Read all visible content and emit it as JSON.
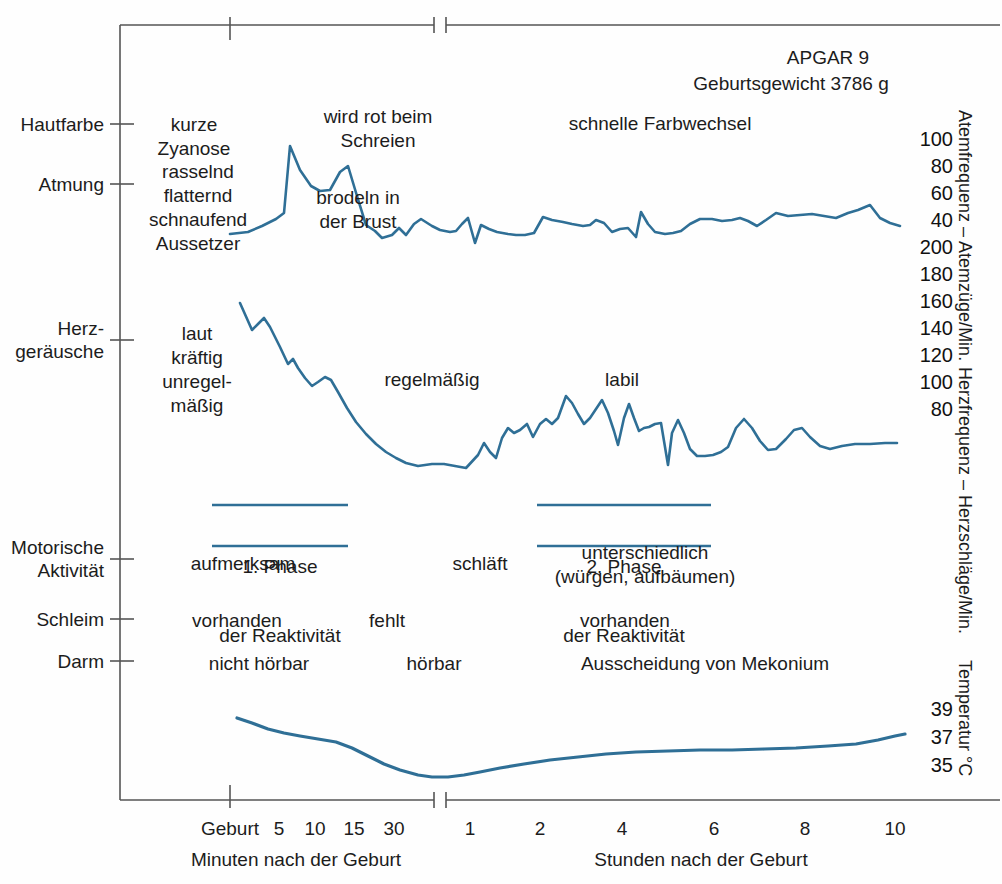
{
  "header": {
    "apgar": "APGAR 9",
    "birth_weight": "Geburtsgewicht 3786 g"
  },
  "left_categories": [
    {
      "label": "Hautfarbe",
      "y": 124
    },
    {
      "label": "Atmung",
      "y": 184
    },
    {
      "label": "Herz-\ngeräusche",
      "y": 340
    },
    {
      "label": "Motorische\nAktivität",
      "y": 559
    },
    {
      "label": "Schleim",
      "y": 619
    },
    {
      "label": "Darm",
      "y": 661
    }
  ],
  "annotations": {
    "skin_color_early": "kurze\nZyanose",
    "skin_color_crying": "wird rot beim\nSchreien",
    "skin_color_fast": "schnelle Farbwechsel",
    "breathing_early": "rasselnd\nflatternd\nschnaufend\nAussetzer",
    "breathing_rattle": "brodeln in\nder Brust",
    "heart_sounds_early": "laut\nkräftig\nunregel-\nmäßig",
    "heart_regular": "regelmäßig",
    "heart_labile": "labil",
    "motor_alert": "aufmerksam",
    "motor_sleeps": "schläft",
    "motor_varied": "unterschiedlich\n(würgen, aufbäumen)",
    "mucus_present_1": "vorhanden",
    "mucus_absent": "fehlt",
    "mucus_present_2": "vorhanden",
    "bowel_not_audible": "nicht hörbar",
    "bowel_audible": "hörbar",
    "bowel_meconium": "Ausscheidung von Mekonium"
  },
  "phases": [
    {
      "line1": "1. Phase",
      "line2": "der Reaktivität",
      "x": 280,
      "y": 505,
      "width": 136
    },
    {
      "line1": "2. Phase",
      "line2": "der Reaktivität",
      "x": 624,
      "y": 505,
      "width": 174
    }
  ],
  "right_axes": {
    "respiration": {
      "title": "Atemfrequenz – Atemzüge/Min.",
      "ticks": [
        "100",
        "80",
        "60",
        "40"
      ]
    },
    "heart_rate": {
      "title": "Herzfrequenz – Herzschläge/Min.",
      "ticks": [
        "200",
        "180",
        "160",
        "140",
        "120",
        "100",
        "80"
      ]
    },
    "temperature": {
      "title": "Temperatur °C",
      "ticks": [
        "39",
        "37",
        "35"
      ]
    }
  },
  "x_axis": {
    "left_caption": "Minuten nach der Geburt",
    "right_caption": "Stunden nach der Geburt",
    "minute_ticks": [
      "Geburt",
      "5",
      "10",
      "15",
      "30"
    ],
    "hour_ticks": [
      "1",
      "2",
      "4",
      "6",
      "8",
      "10"
    ]
  },
  "colors": {
    "curve": "#2f6f96",
    "phase_bar": "#2f6f96",
    "axis": "#555555",
    "text": "#1c1c1c"
  },
  "chart_data": {
    "type": "line",
    "xlabel": "Minuten nach der Geburt / Stunden nach der Geburt",
    "ylabel": "Atemfrequenz – Atemzüge/Min.; Herzfrequenz – Herzschläge/Min.; Temperatur °C",
    "grid": false,
    "legend": "none",
    "axis_break_at_x_px": 440,
    "x_ticks_minutes": [
      {
        "label": "Geburt",
        "px": 230
      },
      {
        "label": "5",
        "px": 277
      },
      {
        "label": "10",
        "px": 313
      },
      {
        "label": "15",
        "px": 352
      },
      {
        "label": "30",
        "px": 394
      }
    ],
    "x_ticks_hours": [
      {
        "label": "1",
        "px": 470
      },
      {
        "label": "2",
        "px": 540
      },
      {
        "label": "4",
        "px": 622
      },
      {
        "label": "6",
        "px": 714
      },
      {
        "label": "8",
        "px": 805
      },
      {
        "label": "10",
        "px": 895
      }
    ],
    "series": [
      {
        "name": "Atemfrequenz (Atemzüge/Min.)",
        "ylim": [
          40,
          100
        ],
        "y_ticks": [
          100,
          80,
          60,
          40
        ],
        "points_px": [
          [
            230,
            234
          ],
          [
            248,
            232
          ],
          [
            262,
            226
          ],
          [
            276,
            219
          ],
          [
            284,
            213
          ],
          [
            290,
            146
          ],
          [
            300,
            170
          ],
          [
            311,
            186
          ],
          [
            320,
            191
          ],
          [
            330,
            190
          ],
          [
            340,
            172
          ],
          [
            348,
            166
          ],
          [
            357,
            196
          ],
          [
            366,
            225
          ],
          [
            375,
            231
          ],
          [
            382,
            238
          ],
          [
            392,
            235
          ],
          [
            399,
            228
          ],
          [
            406,
            235
          ],
          [
            414,
            224
          ],
          [
            421,
            219
          ],
          [
            432,
            226
          ],
          [
            440,
            230
          ],
          [
            450,
            232
          ],
          [
            456,
            231
          ],
          [
            462,
            224
          ],
          [
            468,
            218
          ],
          [
            475,
            243
          ],
          [
            481,
            225
          ],
          [
            489,
            229
          ],
          [
            497,
            232
          ],
          [
            508,
            234
          ],
          [
            516,
            235
          ],
          [
            525,
            235
          ],
          [
            534,
            233
          ],
          [
            543,
            217
          ],
          [
            552,
            220
          ],
          [
            563,
            222
          ],
          [
            572,
            224
          ],
          [
            583,
            226
          ],
          [
            590,
            225
          ],
          [
            596,
            220
          ],
          [
            604,
            223
          ],
          [
            612,
            232
          ],
          [
            620,
            229
          ],
          [
            628,
            228
          ],
          [
            636,
            237
          ],
          [
            641,
            212
          ],
          [
            648,
            224
          ],
          [
            655,
            232
          ],
          [
            665,
            234
          ],
          [
            673,
            233
          ],
          [
            681,
            231
          ],
          [
            690,
            224
          ],
          [
            700,
            219
          ],
          [
            712,
            219
          ],
          [
            722,
            221
          ],
          [
            732,
            220
          ],
          [
            740,
            218
          ],
          [
            748,
            221
          ],
          [
            757,
            226
          ],
          [
            766,
            220
          ],
          [
            776,
            213
          ],
          [
            788,
            216
          ],
          [
            800,
            215
          ],
          [
            812,
            214
          ],
          [
            824,
            216
          ],
          [
            836,
            218
          ],
          [
            848,
            213
          ],
          [
            858,
            210
          ],
          [
            870,
            205
          ],
          [
            880,
            218
          ],
          [
            890,
            223
          ],
          [
            900,
            226
          ]
        ]
      },
      {
        "name": "Herzfrequenz (Herzschläge/Min.)",
        "ylim": [
          80,
          200
        ],
        "y_ticks": [
          200,
          180,
          160,
          140,
          120,
          100,
          80
        ],
        "points_px": [
          [
            240,
            303
          ],
          [
            252,
            330
          ],
          [
            258,
            324
          ],
          [
            264,
            318
          ],
          [
            270,
            327
          ],
          [
            280,
            347
          ],
          [
            288,
            364
          ],
          [
            293,
            359
          ],
          [
            298,
            368
          ],
          [
            305,
            378
          ],
          [
            312,
            386
          ],
          [
            318,
            382
          ],
          [
            325,
            377
          ],
          [
            331,
            380
          ],
          [
            338,
            392
          ],
          [
            347,
            408
          ],
          [
            356,
            422
          ],
          [
            366,
            434
          ],
          [
            376,
            444
          ],
          [
            386,
            452
          ],
          [
            396,
            458
          ],
          [
            406,
            463
          ],
          [
            418,
            466
          ],
          [
            432,
            464
          ],
          [
            444,
            464
          ],
          [
            455,
            466
          ],
          [
            466,
            468
          ],
          [
            478,
            455
          ],
          [
            484,
            443
          ],
          [
            490,
            452
          ],
          [
            496,
            458
          ],
          [
            502,
            438
          ],
          [
            508,
            428
          ],
          [
            514,
            433
          ],
          [
            520,
            430
          ],
          [
            527,
            424
          ],
          [
            533,
            437
          ],
          [
            540,
            424
          ],
          [
            546,
            419
          ],
          [
            552,
            424
          ],
          [
            558,
            418
          ],
          [
            566,
            396
          ],
          [
            572,
            403
          ],
          [
            578,
            414
          ],
          [
            584,
            424
          ],
          [
            590,
            418
          ],
          [
            596,
            409
          ],
          [
            602,
            400
          ],
          [
            608,
            413
          ],
          [
            614,
            431
          ],
          [
            618,
            445
          ],
          [
            624,
            418
          ],
          [
            629,
            404
          ],
          [
            634,
            418
          ],
          [
            639,
            431
          ],
          [
            644,
            428
          ],
          [
            649,
            427
          ],
          [
            655,
            424
          ],
          [
            661,
            423
          ],
          [
            668,
            465
          ],
          [
            672,
            433
          ],
          [
            678,
            420
          ],
          [
            684,
            433
          ],
          [
            690,
            449
          ],
          [
            697,
            456
          ],
          [
            705,
            456
          ],
          [
            713,
            455
          ],
          [
            721,
            452
          ],
          [
            728,
            447
          ],
          [
            736,
            428
          ],
          [
            744,
            419
          ],
          [
            752,
            428
          ],
          [
            760,
            441
          ],
          [
            768,
            450
          ],
          [
            776,
            449
          ],
          [
            786,
            439
          ],
          [
            794,
            430
          ],
          [
            802,
            428
          ],
          [
            810,
            437
          ],
          [
            820,
            446
          ],
          [
            830,
            449
          ],
          [
            842,
            446
          ],
          [
            855,
            444
          ],
          [
            870,
            444
          ],
          [
            885,
            443
          ],
          [
            897,
            443
          ]
        ]
      },
      {
        "name": "Temperatur (°C)",
        "ylim": [
          35,
          39
        ],
        "y_ticks": [
          39,
          37,
          35
        ],
        "points_px": [
          [
            237,
            718
          ],
          [
            252,
            723
          ],
          [
            268,
            729
          ],
          [
            284,
            733
          ],
          [
            300,
            736
          ],
          [
            318,
            739
          ],
          [
            336,
            742
          ],
          [
            352,
            748
          ],
          [
            368,
            756
          ],
          [
            384,
            764
          ],
          [
            400,
            770
          ],
          [
            418,
            775
          ],
          [
            432,
            777
          ],
          [
            448,
            777
          ],
          [
            464,
            775
          ],
          [
            480,
            772
          ],
          [
            500,
            768
          ],
          [
            524,
            764
          ],
          [
            550,
            760
          ],
          [
            578,
            757
          ],
          [
            606,
            754
          ],
          [
            636,
            752
          ],
          [
            668,
            751
          ],
          [
            700,
            750
          ],
          [
            732,
            750
          ],
          [
            764,
            749
          ],
          [
            796,
            748
          ],
          [
            828,
            746
          ],
          [
            856,
            744
          ],
          [
            878,
            740
          ],
          [
            895,
            736
          ],
          [
            905,
            734
          ]
        ]
      }
    ]
  }
}
